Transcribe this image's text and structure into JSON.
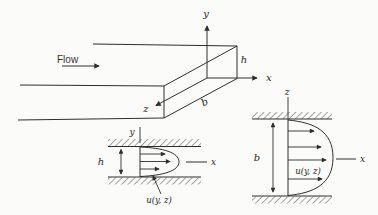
{
  "figure": {
    "colors": {
      "background": "#fbfbf9",
      "ink": "#2e2e2e"
    },
    "duct_view": {
      "flow_label": "Flow",
      "y_axis_label": "y",
      "x_axis_label": "x",
      "z_axis_label": "z",
      "height_label": "h",
      "width_label": "b"
    },
    "side_view": {
      "y_axis_label": "y",
      "x_axis_label": "x",
      "height_label": "h",
      "velocity_profile_label": "u(y, z)"
    },
    "end_view": {
      "z_axis_label": "z",
      "x_axis_label": "x",
      "width_label": "b",
      "velocity_profile_label": "u(y, z)"
    }
  }
}
